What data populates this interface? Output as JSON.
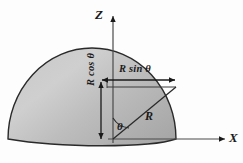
{
  "figure": {
    "kind": "geometry-diagram",
    "background_color": "#fdfdfd",
    "stroke_color": "#1a1a1a",
    "dome": {
      "name": "hemisphere-dome",
      "fill_light": "#d8d8d8",
      "fill_dark": "#a8a8a8",
      "edge_color": "#2a2a2a",
      "apex_x": 92,
      "apex_y": 48,
      "base_y": 140,
      "left_x": 8,
      "right_x": 176
    },
    "axes": [
      {
        "name": "z-axis",
        "label": "Z",
        "direction": "up"
      },
      {
        "name": "x-axis",
        "label": "X",
        "direction": "right"
      }
    ],
    "origin": {
      "x": 113,
      "y": 139
    },
    "radius_endpoint": {
      "x": 175,
      "y": 87
    },
    "dimensions": [
      {
        "name": "horizontal-projection",
        "label": "R sin θ",
        "orientation": "horizontal",
        "from_x": 101,
        "to_x": 176,
        "y": 80
      },
      {
        "name": "vertical-projection",
        "label": "R cos θ",
        "orientation": "vertical",
        "x": 101,
        "from_y": 81,
        "to_y": 140
      }
    ],
    "radius": {
      "name": "radius-line",
      "label": "R"
    },
    "angle": {
      "name": "angle-theta",
      "label": "θ",
      "vertex": "origin",
      "between": [
        "z-axis",
        "radius-line"
      ]
    }
  }
}
